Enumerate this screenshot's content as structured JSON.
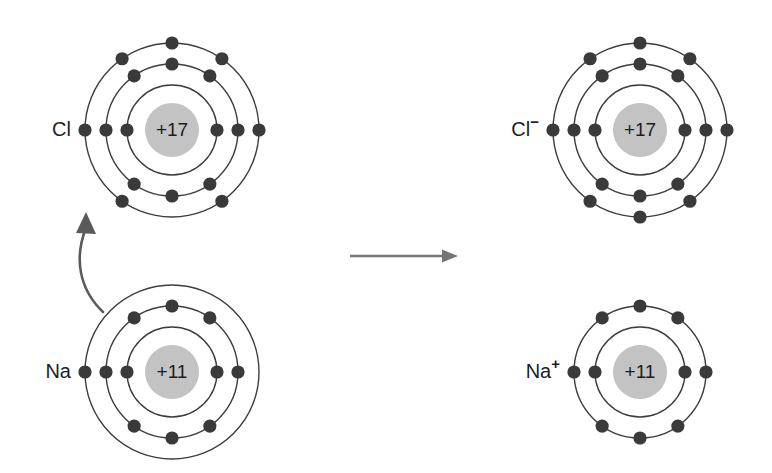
{
  "figure": {
    "background_color": "#ffffff",
    "width": 772,
    "height": 473
  },
  "palette": {
    "shell_stroke": "#3c3c3c",
    "electron_fill": "#3a3a3a",
    "nucleus_fill": "#c3c3c3",
    "text_color": "#1d1d1d",
    "reaction_arrow": "#757575",
    "transfer_arrow": "#5a5a5a"
  },
  "atoms": {
    "chlorine_atom": {
      "label": "Cl",
      "charge": "",
      "nucleus_label": "+17",
      "center": {
        "x": 172,
        "y": 130
      },
      "nucleus_radius": 27,
      "shell_radii": [
        45,
        66,
        87
      ],
      "shell_electron_counts": [
        2,
        8,
        7
      ],
      "total_electrons": 17
    },
    "sodium_atom": {
      "label": "Na",
      "charge": "",
      "nucleus_label": "+11",
      "center": {
        "x": 172,
        "y": 372
      },
      "nucleus_radius": 27,
      "shell_radii": [
        45,
        66,
        87
      ],
      "shell_electron_counts": [
        2,
        8,
        1
      ],
      "total_electrons": 11
    },
    "chloride_ion": {
      "label": "Cl",
      "charge": "−",
      "nucleus_label": "+17",
      "center": {
        "x": 640,
        "y": 130
      },
      "nucleus_radius": 27,
      "shell_radii": [
        45,
        66,
        87
      ],
      "shell_electron_counts": [
        2,
        8,
        8
      ],
      "total_electrons": 18
    },
    "sodium_ion": {
      "label": "Na",
      "charge": "+",
      "nucleus_label": "+11",
      "center": {
        "x": 640,
        "y": 372
      },
      "nucleus_radius": 27,
      "shell_radii": [
        45,
        66
      ],
      "shell_electron_counts": [
        2,
        8
      ],
      "total_electrons": 10
    }
  },
  "arrows": {
    "reaction_arrow": {
      "name": "reaction-arrow",
      "direction": "right",
      "x_start": 350,
      "x_end": 458,
      "y": 256
    },
    "electron_transfer_arrow": {
      "name": "electron-transfer-arrow",
      "direction": "up",
      "from": "sodium outer shell",
      "to": "chlorine outer shell"
    }
  }
}
